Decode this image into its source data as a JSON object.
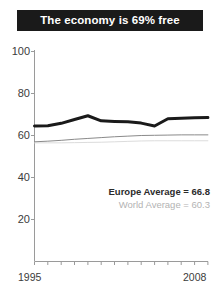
{
  "title": {
    "text": "The economy is 69% free",
    "background_color": "#1a1a1a",
    "text_color": "#ffffff"
  },
  "legend": {
    "europe_label": "Europe Average = 66.8",
    "world_label": "World Average = 60.3",
    "europe_color": "#2b2b2b",
    "world_color": "#b3b3b3"
  },
  "chart_data": {
    "type": "line",
    "title": "The economy is 69% free",
    "xlabel": "",
    "ylabel": "",
    "xlim": [
      1995,
      2008
    ],
    "ylim": [
      0,
      100
    ],
    "grid": false,
    "legend_position": "inside-bottom-right",
    "ytick_labels": [
      "100",
      "80",
      "60",
      "40",
      "20"
    ],
    "ytick_values": [
      100,
      80,
      60,
      40,
      20
    ],
    "xtick_labels": [
      "1995",
      "2008"
    ],
    "xtick_values": [
      1995,
      2008
    ],
    "x": [
      1995,
      1996,
      1997,
      1998,
      1999,
      2000,
      2001,
      2002,
      2003,
      2004,
      2005,
      2006,
      2007,
      2008
    ],
    "series": [
      {
        "name": "Europe Average",
        "color": "#1a1a1a",
        "linewidth": 3,
        "average": 66.8,
        "values": [
          64.5,
          64.6,
          65.8,
          67.6,
          69.4,
          67.0,
          66.7,
          66.5,
          65.9,
          64.5,
          68.0,
          68.2,
          68.4,
          68.6
        ]
      },
      {
        "name": "World Average",
        "color": "#8a8a8a",
        "linewidth": 1,
        "average": 60.3,
        "values": [
          57.0,
          57.3,
          57.7,
          58.2,
          58.6,
          59.0,
          59.4,
          59.7,
          60.0,
          60.1,
          60.2,
          60.3,
          60.3,
          60.3
        ]
      },
      {
        "name": "Lower Band",
        "color": "#dcdcdc",
        "linewidth": 1,
        "values": [
          56.5,
          56.5,
          56.5,
          56.6,
          56.7,
          56.8,
          57.0,
          57.2,
          57.4,
          57.5,
          57.5,
          57.5,
          57.5,
          57.5
        ]
      }
    ]
  },
  "axes": {
    "line_color": "#9a9a9a",
    "tick_color": "#9a9a9a",
    "label_color": "#3b3b3b"
  }
}
